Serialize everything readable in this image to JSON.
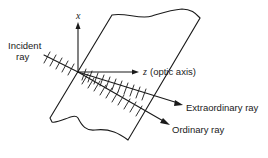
{
  "diagram": {
    "labels": {
      "incident_line1": "Incident",
      "incident_line2": "ray",
      "x_axis": "x",
      "z_axis": "z",
      "z_axis_suffix": "(optic axis)",
      "extraordinary": "Extraordinary ray",
      "ordinary": "Ordinary ray"
    },
    "colors": {
      "stroke": "#1a1a1a",
      "background": "#ffffff"
    }
  }
}
